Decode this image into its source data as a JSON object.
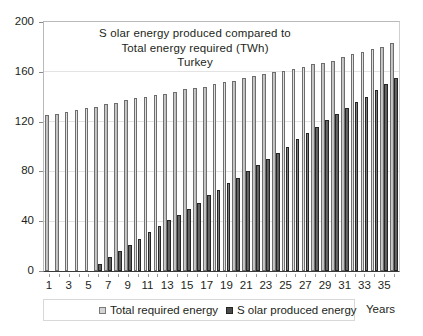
{
  "chart_data": {
    "type": "bar",
    "title_lines": [
      "S olar energy produced compared to",
      "Total energy required (TWh)",
      "Turkey"
    ],
    "xlabel": "Years",
    "ylabel": "",
    "ylim": [
      0,
      200
    ],
    "yticks": [
      0,
      40,
      80,
      120,
      160,
      200
    ],
    "ytick_labels": [
      "0",
      "40",
      "80",
      "120",
      "160",
      "200"
    ],
    "grid": true,
    "legend_position": "bottom",
    "categories": [
      1,
      2,
      3,
      4,
      5,
      6,
      7,
      8,
      9,
      10,
      11,
      12,
      13,
      14,
      15,
      16,
      17,
      18,
      19,
      20,
      21,
      22,
      23,
      24,
      25,
      26,
      27,
      28,
      29,
      30,
      31,
      32,
      33,
      34,
      35,
      36
    ],
    "xtick_labels": [
      "1",
      "3",
      "5",
      "7",
      "9",
      "11",
      "13",
      "15",
      "17",
      "19",
      "21",
      "23",
      "25",
      "27",
      "29",
      "31",
      "33",
      "35"
    ],
    "series": [
      {
        "name": "Total required energy",
        "color": "#c9c9c9",
        "values": [
          125,
          126,
          128,
          129,
          131,
          132,
          134,
          135,
          137,
          139,
          140,
          141,
          142,
          144,
          146,
          147,
          148,
          150,
          152,
          153,
          155,
          157,
          158,
          160,
          161,
          162,
          164,
          166,
          167,
          169,
          172,
          174,
          176,
          178,
          180,
          183
        ]
      },
      {
        "name": "Solar produced energy",
        "color": "#4a4a4a",
        "values": [
          0,
          0,
          0,
          0,
          0,
          6,
          11,
          16,
          21,
          26,
          31,
          36,
          41,
          45,
          50,
          55,
          61,
          65,
          71,
          75,
          80,
          85,
          90,
          95,
          100,
          106,
          111,
          116,
          121,
          126,
          131,
          136,
          140,
          145,
          150,
          155
        ]
      }
    ]
  },
  "legend": {
    "items": [
      {
        "label": "Total required energy",
        "swatch": "swatch-total"
      },
      {
        "label": "S olar produced energy",
        "swatch": "swatch-solar"
      }
    ]
  },
  "axis": {
    "x_title": "Years"
  }
}
